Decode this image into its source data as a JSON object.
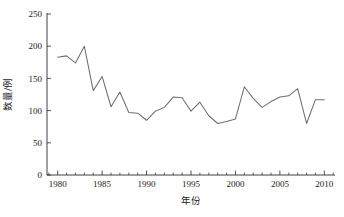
{
  "chart_data": {
    "type": "line",
    "title": "",
    "xlabel": "年份",
    "ylabel": "数量/例",
    "xlim": [
      1978.8,
      2011.2
    ],
    "ylim": [
      0,
      250
    ],
    "grid": false,
    "legend": null,
    "line_color": "#6e6e6e",
    "x": [
      1980,
      1981,
      1982,
      1983,
      1984,
      1985,
      1986,
      1987,
      1988,
      1989,
      1990,
      1991,
      1992,
      1993,
      1994,
      1995,
      1996,
      1997,
      1998,
      1999,
      2000,
      2001,
      2002,
      2003,
      2004,
      2005,
      2006,
      2007,
      2008,
      2009,
      2010
    ],
    "values": [
      183,
      185,
      174,
      200,
      131,
      153,
      106,
      129,
      97,
      96,
      85,
      99,
      105,
      121,
      120,
      99,
      113,
      92,
      80,
      83,
      87,
      137,
      119,
      105,
      114,
      121,
      123,
      134,
      80,
      117,
      117
    ],
    "xticks": [
      1980,
      1985,
      1990,
      1995,
      2000,
      2005,
      2010
    ],
    "xtick_labels": [
      "1980",
      "1985",
      "1990",
      "1995",
      "2000",
      "2005",
      "2010"
    ],
    "yticks": [
      0,
      50,
      100,
      150,
      200,
      250
    ],
    "ytick_labels": [
      "0",
      "50",
      "100",
      "150",
      "200",
      "250"
    ],
    "x_minor_step": 1,
    "series_name": "数量"
  },
  "axes": {
    "x_axis_name": "year-axis",
    "y_axis_name": "count-axis"
  }
}
